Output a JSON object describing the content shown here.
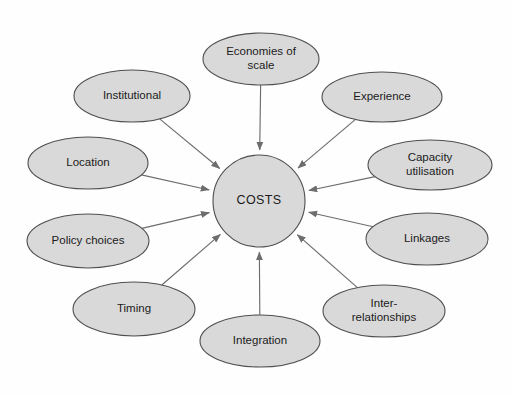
{
  "diagram": {
    "type": "hub-and-spoke",
    "center": {
      "label": "COSTS",
      "shape": "circle",
      "cx": 259,
      "cy": 201,
      "r": 46
    },
    "style": {
      "background_color": "#fefefe",
      "node_fill": "#d9d9d9",
      "node_stroke": "#4f4f4f",
      "edge_color": "#6d6d6d",
      "text_color": "#1b1b1b"
    },
    "nodes": [
      {
        "id": "economies-of-scale",
        "label": "Economies of scale",
        "lines": [
          "Economies of",
          "scale"
        ],
        "cx": 261,
        "cy": 59,
        "rx": 58,
        "ry": 26,
        "arrow_to_center": true
      },
      {
        "id": "institutional",
        "label": "Institutional",
        "lines": [
          "Institutional"
        ],
        "cx": 132,
        "cy": 96,
        "rx": 58,
        "ry": 26,
        "arrow_to_center": true
      },
      {
        "id": "location",
        "label": "Location",
        "lines": [
          "Location"
        ],
        "cx": 88,
        "cy": 163,
        "rx": 60,
        "ry": 26,
        "arrow_to_center": true
      },
      {
        "id": "policy-choices",
        "label": "Policy choices",
        "lines": [
          "Policy choices"
        ],
        "cx": 88,
        "cy": 241,
        "rx": 61,
        "ry": 27,
        "arrow_to_center": true
      },
      {
        "id": "timing",
        "label": "Timing",
        "lines": [
          "Timing"
        ],
        "cx": 134,
        "cy": 309,
        "rx": 61,
        "ry": 27,
        "arrow_to_center": true
      },
      {
        "id": "integration",
        "label": "Integration",
        "lines": [
          "Integration"
        ],
        "cx": 260,
        "cy": 341,
        "rx": 60,
        "ry": 26,
        "arrow_to_center": true
      },
      {
        "id": "inter-relationships",
        "label": "Inter-relationships",
        "lines": [
          "Inter-",
          "relationships"
        ],
        "cx": 384,
        "cy": 311,
        "rx": 61,
        "ry": 26,
        "arrow_to_center": true
      },
      {
        "id": "linkages",
        "label": "Linkages",
        "lines": [
          "Linkages"
        ],
        "cx": 427,
        "cy": 239,
        "rx": 61,
        "ry": 26,
        "arrow_to_center": true
      },
      {
        "id": "capacity-utilisation",
        "label": "Capacity utilisation",
        "lines": [
          "Capacity",
          "utilisation"
        ],
        "cx": 430,
        "cy": 165,
        "rx": 62,
        "ry": 25,
        "arrow_to_center": true
      },
      {
        "id": "experience",
        "label": "Experience",
        "lines": [
          "Experience"
        ],
        "cx": 382,
        "cy": 97,
        "rx": 60,
        "ry": 25,
        "arrow_to_center": true
      }
    ]
  }
}
